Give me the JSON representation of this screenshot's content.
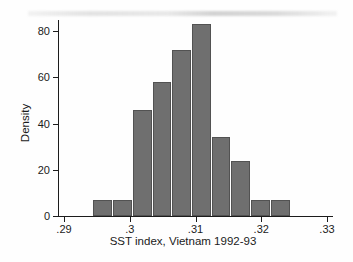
{
  "figure": {
    "background": "#fefefe",
    "artifact_note": "faint horizontal scan smudge along top edge"
  },
  "chart_data": {
    "type": "bar",
    "subtype": "histogram",
    "title": "",
    "xlabel": "SST index, Vietnam 1992-93",
    "ylabel": "Density",
    "xlim": [
      0.29,
      0.33
    ],
    "ylim": [
      0,
      85
    ],
    "grid": false,
    "legend": null,
    "xticks": {
      "values": [
        0.29,
        0.3,
        0.31,
        0.32,
        0.33
      ],
      "labels": [
        ".29",
        ".3",
        ".31",
        ".32",
        ".33"
      ]
    },
    "yticks": {
      "values": [
        0,
        20,
        40,
        60,
        80
      ],
      "labels": [
        "0",
        "20",
        "40",
        "60",
        "80"
      ]
    },
    "bin_edges": [
      0.2944,
      0.2974,
      0.3004,
      0.3034,
      0.3064,
      0.3094,
      0.3124,
      0.3154,
      0.3184,
      0.3214,
      0.3244
    ],
    "values": [
      7,
      7,
      46,
      58,
      72,
      83,
      34,
      24,
      7,
      7
    ],
    "bar_color": "#6f6f6f",
    "bar_border_color": "#525252",
    "axis_color": "#1c1c1c",
    "text_color": "#1b1b1b"
  }
}
